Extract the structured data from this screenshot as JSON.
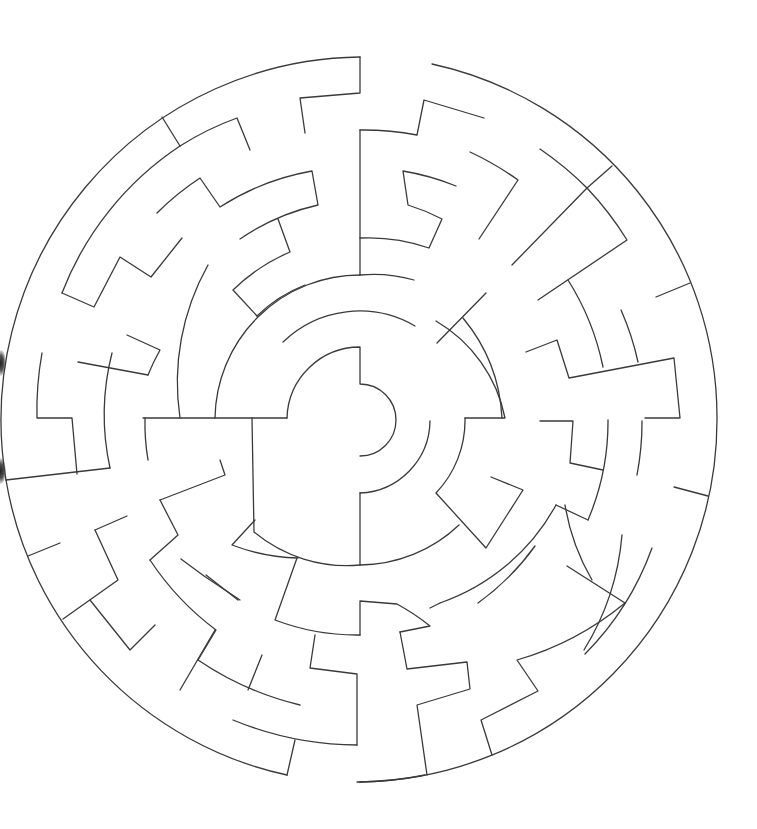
{
  "puzzle": {
    "type": "circular-maze",
    "center": [
      360,
      420
    ],
    "outer_radius": 362,
    "stroke_color": "#3a3a3a",
    "background": "#ffffff",
    "ring_radii": [
      73,
      145,
      215,
      290,
      362
    ]
  },
  "walls": [
    "M360,57 L360,93 L300,98 L305,133",
    "M432,64 A362,362 0 0 1 717,420 A362,362 0 0 1 360,782",
    "M360,57 A363,363 0 0 0 6,480",
    "M6,480 A363,363 0 0 0 287,775",
    "M162,117 L180,146",
    "M180,146 A290,290 0 0 1 237,118 L250,150",
    "M62,293 A310,310 0 0 1 180,146",
    "M62,293 L94,307 L120,257 L151,277 L182,238",
    "M157,213 A270,270 0 0 1 200,178 L220,207 A250,250 0 0 1 312,171 L318,205 A225,225 0 0 0 240,239",
    "M278,219 L290,252 A185,185 0 0 0 233,290 L257,316",
    "M257,316 A140,140 0 0 1 305,285",
    "M208,265 A240,240 0 0 0 180,418",
    "M127,335 L160,350 A220,220 0 0 0 148,375",
    "M78,362 L148,375",
    "M42,353 A320,320 0 0 0 37,418 L72,418 L77,474",
    "M112,353 A250,250 0 0 0 110,468",
    "M6,480 L110,468",
    "M143,418 L287,418",
    "M287,418 A73,73 0 0 1 360,347 L360,384 A36,36 0 0 1 360,456",
    "M215,418 A145,145 0 0 1 360,275",
    "M283,342 A110,110 0 0 1 415,326",
    "M360,130 L360,275",
    "M360,130 A290,290 0 0 1 417,135 L424,100 L484,118",
    "M360,238 A182,182 0 0 1 429,248 L442,219 A205,205 0 0 0 408,205 L403,171 A250,250 0 0 1 456,186",
    "M360,275 A145,145 0 0 1 414,280",
    "M470,152 A300,300 0 0 1 518,180 L479,239",
    "M540,149 A330,330 0 0 1 587,188 L612,166",
    "M512,265 L587,188",
    "M587,188 A320,320 0 0 1 627,240 L538,300",
    "M437,343 L486,293",
    "M436,321 A145,145 0 0 1 505,418 L465,418",
    "M463,318 A170,170 0 0 1 502,418",
    "M568,280 A260,260 0 0 1 603,367",
    "M621,310 A270,270 0 0 1 638,362",
    "M526,352 L557,340 L569,378 L674,358 L680,418 L645,418",
    "M656,297 L690,283",
    "M540,421 L573,421 L570,463 L603,470",
    "M608,420 A250,250 0 0 1 588,520",
    "M642,421 A280,280 0 0 1 637,475",
    "M674,487 L708,496",
    "M430,421 A73,73 0 0 1 360,493",
    "M465,418 A105,105 0 0 1 436,493 L486,548 L523,490 L491,477",
    "M360,493 L360,565 A145,145 0 0 0 459,525",
    "M360,565 A145,145 0 0 1 254,532 L252,418",
    "M145,418 A220,220 0 0 0 148,460",
    "M478,603 A250,250 0 0 0 535,546",
    "M556,505 L588,520",
    "M556,505 A210,210 0 0 1 440,603",
    "M565,505 A220,220 0 0 0 592,580",
    "M622,535 A260,260 0 0 1 584,650",
    "M652,548 A290,290 0 0 1 585,654",
    "M567,566 L625,603",
    "M625,603 A300,300 0 0 1 517,660 L538,691 L481,720 L492,755",
    "M440,603 L430,608",
    "M400,632 L407,669 L467,662 L470,689 L417,705 L427,775",
    "M400,632 L430,626 A230,230 0 0 0 397,604 L360,601 L360,635",
    "M298,558 A200,200 0 0 1 232,545 L255,520",
    "M297,558 L275,620 A230,230 0 0 0 360,635",
    "M315,635 L310,668 L357,674 L357,745",
    "M357,745 A330,330 0 0 1 233,720",
    "M160,500 L225,475 L220,460",
    "M160,500 L178,535 L150,560",
    "M150,560 A280,280 0 0 0 216,630 L198,660",
    "M181,559 L204,576 L240,600",
    "M206,575 L238,600",
    "M198,660 A310,310 0 0 0 300,705",
    "M248,690 L262,655",
    "M95,530 L127,516",
    "M95,530 L118,580 L63,619",
    "M28,556 L60,543",
    "M90,600 L130,650 L155,625",
    "M180,690 L215,630",
    "M287,775 L295,740",
    "M360,782 A362,362 0 0 1 357,782",
    "M425,775 A360,360 0 0 1 360,782"
  ]
}
